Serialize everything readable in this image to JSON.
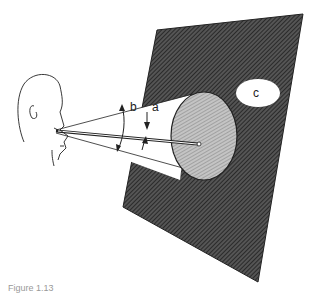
{
  "figure": {
    "caption": "Figure 1.13",
    "labels": {
      "a": "a",
      "b": "b",
      "c": "c"
    },
    "elements": [
      "observer-head",
      "visual-cone",
      "screen-plane",
      "fixation-disc",
      "line-of-sight",
      "target-spot"
    ],
    "colors": {
      "plane": "#3d3d3d",
      "disc": "#a9a9a9",
      "line": "#222222",
      "background": "#ffffff"
    }
  }
}
